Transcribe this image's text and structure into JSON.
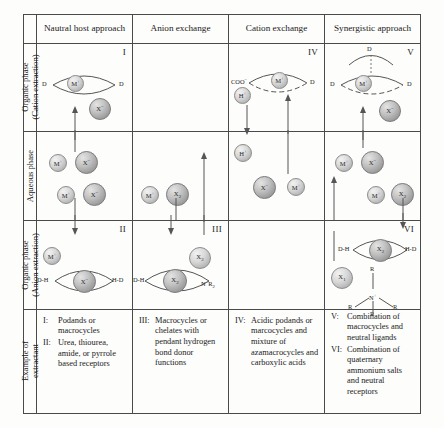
{
  "figure": {
    "type": "diagram"
  },
  "columns": [
    {
      "id": "neutral-host",
      "label": "Nautral host approach"
    },
    {
      "id": "anion-exchange",
      "label": "Anion exchange"
    },
    {
      "id": "cation-exchange",
      "label": "Cation exchange"
    },
    {
      "id": "synergistic",
      "label": "Synergistic approach"
    }
  ],
  "rows": [
    {
      "id": "organic-cation",
      "line1": "Organic phase",
      "line2": "(Cation extraction)"
    },
    {
      "id": "aqueous",
      "line1": "Aqueous phase",
      "line2": ""
    },
    {
      "id": "organic-anion",
      "line1": "Organic phase",
      "line2": "(Anion extraction)"
    },
    {
      "id": "example",
      "line1": "Example of",
      "line2": "extractant"
    }
  ],
  "panels": {
    "I": {
      "numeral": "I",
      "host_left": "D",
      "host_right": "D",
      "center_ion": "M+",
      "free_ion": "X−"
    },
    "IV": {
      "numeral": "IV",
      "host_left": "COO−",
      "host_right": "D",
      "center_ion": "M+",
      "free_ion": "H+"
    },
    "V": {
      "numeral": "V",
      "host_top": "D",
      "host_left": "D",
      "host_right": "D",
      "center_ion": "M+",
      "free_ion": "X−"
    },
    "II": {
      "numeral": "II",
      "host_left": "D-H",
      "host_right": "H-D",
      "center_ion": "X−",
      "free_ion": "M+"
    },
    "III": {
      "numeral": "III",
      "host_left": "D-H",
      "host_right": "N+R2",
      "center_ion": "X2−",
      "free_ion": "X2−"
    },
    "VI": {
      "numeral": "VI",
      "host_left": "D-H",
      "host_right": "H-D",
      "center_ion": "X2−",
      "free_ion": "X1−",
      "ammonium_center": "N+",
      "ammonium_arms": [
        "R",
        "R",
        "R",
        "R"
      ]
    }
  },
  "aqueous": {
    "neutral_host": [
      {
        "cation": "M+",
        "anion": "X−"
      },
      {
        "cation": "M+",
        "anion": "X−"
      }
    ],
    "anion_exchange": [
      {
        "cation": "M+",
        "anion": "X2−"
      }
    ],
    "cation_exchange": [
      {
        "ion": "H+"
      },
      {
        "anion": "X−"
      },
      {
        "cation": "M+"
      }
    ],
    "synergistic": [
      {
        "cation": "M+",
        "anion": "X−"
      },
      {
        "cation": "M+",
        "anion": "X2−"
      }
    ]
  },
  "examples": {
    "neutral_host": [
      {
        "num": "I:",
        "text": "Podands or macrocycles"
      },
      {
        "num": "II:",
        "text": "Urea, thiourea, amide, or pyrrole based receptors"
      }
    ],
    "anion_exchange": [
      {
        "num": "III:",
        "text": "Macrocycles or chelates with pendant hydrogen bond donor functions"
      }
    ],
    "cation_exchange": [
      {
        "num": "IV:",
        "text": "Acidic podands or marcocycles and mixture of azamacrocycles and carboxylic acids"
      }
    ],
    "synergistic": [
      {
        "num": "V:",
        "text": "Combination of macrocycles and neutral ligands"
      },
      {
        "num": "VI:",
        "text": "Combination of quaternary ammonium salts and neutral receptors"
      }
    ]
  },
  "colors": {
    "border": "#4a4a4a",
    "text": "#1a1a1a",
    "sphere_light": "#d9d9d9",
    "sphere_dark": "#9b9b9b"
  }
}
